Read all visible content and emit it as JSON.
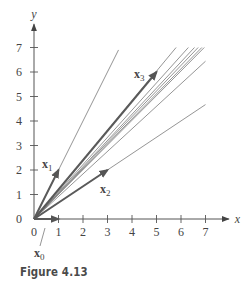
{
  "figure": {
    "caption": "Figure 4.13"
  },
  "chart_data": {
    "type": "line",
    "title": "",
    "xlabel": "x",
    "ylabel": "y",
    "xlim": [
      0,
      7.6
    ],
    "ylim": [
      0,
      7.6
    ],
    "x_ticks": [
      0,
      1,
      2,
      3,
      4,
      5,
      6,
      7
    ],
    "y_ticks": [
      0,
      1,
      2,
      3,
      4,
      5,
      6,
      7
    ],
    "x_tick_labels": [
      "0",
      "1",
      "2",
      "3",
      "4",
      "5",
      "6",
      "7"
    ],
    "y_tick_labels": [
      "0",
      "1",
      "2",
      "3",
      "4",
      "5",
      "6",
      "7"
    ],
    "grid": false,
    "legend": "none",
    "vectors": [
      {
        "name": "x0",
        "label": "x",
        "subscript": "0",
        "from": [
          0,
          0
        ],
        "to": [
          1,
          0
        ]
      },
      {
        "name": "x1",
        "label": "x",
        "subscript": "1",
        "from": [
          0,
          0
        ],
        "to": [
          1,
          2
        ]
      },
      {
        "name": "x2",
        "label": "x",
        "subscript": "2",
        "from": [
          0,
          0
        ],
        "to": [
          3,
          2
        ]
      },
      {
        "name": "x3",
        "label": "x",
        "subscript": "3",
        "from": [
          0,
          0
        ],
        "to": [
          5,
          6
        ]
      }
    ],
    "direction_lines": [
      {
        "slope": 2.0,
        "end": [
          3.45,
          6.9
        ]
      },
      {
        "slope": 1.2,
        "end": [
          5.8,
          7.0
        ]
      },
      {
        "slope": 1.11,
        "end": [
          6.3,
          7.0
        ]
      },
      {
        "slope": 1.07,
        "end": [
          6.55,
          7.0
        ]
      },
      {
        "slope": 1.05,
        "end": [
          6.7,
          7.0
        ]
      },
      {
        "slope": 1.03,
        "end": [
          6.85,
          7.0
        ]
      },
      {
        "slope": 1.01,
        "end": [
          6.95,
          7.0
        ]
      },
      {
        "slope": 0.92,
        "end": [
          7.0,
          6.44
        ]
      },
      {
        "slope": 0.667,
        "end": [
          7.0,
          4.67
        ]
      }
    ]
  },
  "style": {
    "axis_color": "#555555",
    "vector_color": "#5a5a5a",
    "line_color": "#7a7a7a",
    "text_color": "#444444",
    "caption_color": "#4a4a4a"
  }
}
